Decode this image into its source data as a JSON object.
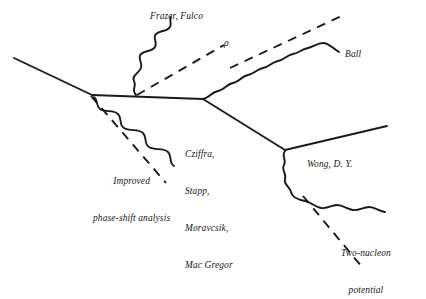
{
  "diagram": {
    "type": "feynman-style-flow-diagram",
    "title": "",
    "background_color": "#ffffff",
    "line_color": "#1a1a1a",
    "labels": {
      "frazer_fulco": "Frazer, Fulco",
      "rho": "ρ",
      "ball": "Ball",
      "cziffra_lines": [
        "Cziffra,",
        "Stapp,",
        "Moravcsik,",
        "Mac Gregor"
      ],
      "improved_lines": [
        "Improved",
        "phase-shift analysis"
      ],
      "wong": "Wong, D. Y.",
      "two_nucleon_lines": [
        "Two-nucleon",
        "potential"
      ]
    },
    "edges": [
      {
        "name": "incoming-solid-left",
        "style": "solid"
      },
      {
        "name": "central-solid-horizontal",
        "style": "solid"
      },
      {
        "name": "vertex1-wavy-down-right",
        "style": "wavy"
      },
      {
        "name": "vertex1-dashed-down-right",
        "style": "dashed"
      },
      {
        "name": "vertex1-wavy-up-right",
        "style": "wavy"
      },
      {
        "name": "vertex1-dashed-up-right",
        "style": "dashed"
      },
      {
        "name": "vertex2-wavy-up-right",
        "style": "wavy"
      },
      {
        "name": "vertex2-dashed-up-right",
        "style": "dashed"
      },
      {
        "name": "vertex2-solid-down-right",
        "style": "solid"
      },
      {
        "name": "vertex3-solid-up-right",
        "style": "solid"
      },
      {
        "name": "vertex3-wavy-down-right",
        "style": "wavy"
      },
      {
        "name": "vertex3-dashed-down-right",
        "style": "dashed"
      }
    ]
  }
}
